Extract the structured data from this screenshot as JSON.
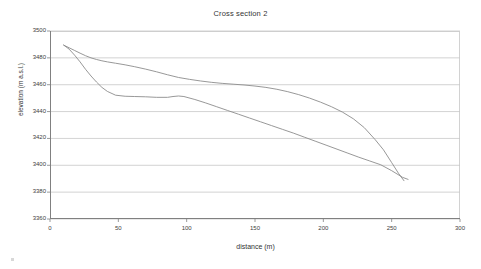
{
  "chart_data": {
    "type": "line",
    "title": "Cross section 2",
    "xlabel": "distance (m)",
    "ylabel": "elevation (m a.s.l.)",
    "xlim": [
      0,
      300
    ],
    "ylim": [
      3360,
      3500
    ],
    "xticks": [
      0,
      50,
      100,
      150,
      200,
      250,
      300
    ],
    "yticks": [
      3360,
      3380,
      3400,
      3420,
      3440,
      3460,
      3480,
      3500
    ],
    "xtick_labels": [
      "0",
      "50",
      "100",
      "150",
      "200",
      "250",
      "300"
    ],
    "ytick_labels": [
      "3360",
      "3380",
      "3400",
      "3420",
      "3440",
      "3460",
      "3480",
      "3500"
    ],
    "grid": "horizontal",
    "legend": "none",
    "line_color": "#8c8c8c",
    "grid_color": "#c8c8c8",
    "axis_color": "#808080",
    "series": [
      {
        "name": "upper profile",
        "x": [
          10,
          14,
          18,
          22,
          26,
          30,
          34,
          38,
          42,
          48,
          55,
          62,
          70,
          78,
          86,
          94,
          102,
          110,
          118,
          126,
          134,
          142,
          150,
          158,
          166,
          174,
          182,
          190,
          198,
          206,
          214,
          222,
          230,
          238,
          244,
          250,
          255,
          259
        ],
        "y": [
          3489.5,
          3487.5,
          3485.5,
          3483.5,
          3481.6,
          3480.0,
          3478.8,
          3477.8,
          3477.0,
          3476.0,
          3474.8,
          3473.4,
          3471.6,
          3469.6,
          3467.4,
          3465.4,
          3464.0,
          3462.8,
          3461.8,
          3461.0,
          3460.4,
          3459.8,
          3459.0,
          3458.0,
          3456.6,
          3454.8,
          3452.6,
          3450.0,
          3447.0,
          3443.6,
          3439.6,
          3434.6,
          3428.0,
          3419.0,
          3411.5,
          3402.0,
          3394.0,
          3388.5
        ]
      },
      {
        "name": "lower profile",
        "x": [
          10,
          14,
          18,
          22,
          26,
          30,
          34,
          38,
          42,
          48,
          55,
          62,
          70,
          78,
          86,
          90,
          94,
          98,
          106,
          114,
          122,
          130,
          138,
          146,
          154,
          162,
          170,
          178,
          186,
          194,
          202,
          210,
          218,
          226,
          234,
          242,
          250,
          258,
          262
        ],
        "y": [
          3489.5,
          3486.5,
          3482.0,
          3477.0,
          3471.5,
          3466.5,
          3462.0,
          3458.0,
          3455.0,
          3452.2,
          3451.4,
          3451.2,
          3451.0,
          3450.6,
          3450.6,
          3451.2,
          3451.6,
          3451.2,
          3449.0,
          3446.4,
          3443.6,
          3440.8,
          3438.0,
          3435.2,
          3432.4,
          3429.6,
          3426.8,
          3424.0,
          3421.0,
          3418.0,
          3415.0,
          3412.0,
          3409.0,
          3406.0,
          3403.2,
          3400.4,
          3396.0,
          3391.0,
          3389.5
        ]
      }
    ]
  }
}
